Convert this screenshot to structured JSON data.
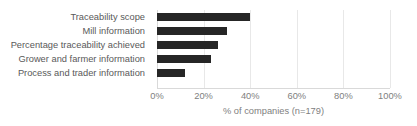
{
  "chart_data": {
    "type": "bar",
    "orientation": "horizontal",
    "title": "",
    "subtitle": "",
    "xlabel": "% of companies (n=179)",
    "ylabel": "",
    "categories": [
      "Traceability scope",
      "Mill information",
      "Percentage traceability achieved",
      "Grower and farmer information",
      "Process and trader information"
    ],
    "values": [
      40,
      30,
      26,
      23,
      12
    ],
    "xlim": [
      0,
      100
    ],
    "xticks": [
      0,
      20,
      40,
      60,
      80,
      100
    ],
    "xtick_labels": [
      "0%",
      "20%",
      "40%",
      "60%",
      "80%",
      "100%"
    ],
    "grid": true,
    "grid_axis": "x",
    "legend": false,
    "legend_position": "none",
    "bar_color": "#262626",
    "grid_color": "#e8e8e8",
    "axis_color": "#d9d9d9",
    "label_color": "#595959",
    "tick_color": "#808080"
  }
}
